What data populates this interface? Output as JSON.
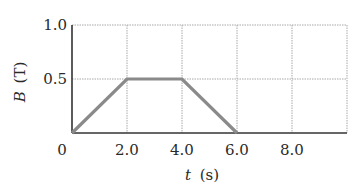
{
  "chart_data": {
    "type": "line",
    "title": "",
    "xlabel": "t (s)",
    "xlabel_var": "t",
    "xlabel_unit": "(s)",
    "ylabel": "B (T)",
    "ylabel_var": "B",
    "ylabel_unit": "(T)",
    "xlim": [
      0,
      10
    ],
    "ylim": [
      0,
      1.0
    ],
    "x_ticks": [
      0,
      2.0,
      4.0,
      6.0,
      8.0
    ],
    "x_tick_labels": [
      "0",
      "2.0",
      "4.0",
      "6.0",
      "8.0"
    ],
    "y_ticks": [
      0.5,
      1.0
    ],
    "y_tick_labels": [
      "0.5",
      "1.0"
    ],
    "grid": true,
    "legend": null,
    "series": [
      {
        "name": "B(t)",
        "x": [
          0,
          2.0,
          4.0,
          6.0
        ],
        "y": [
          0,
          0.5,
          0.5,
          0
        ]
      }
    ]
  },
  "style": {
    "line_color": "#8a8a8a",
    "axis_color": "#333333",
    "grid_color": "#a8a8a8"
  }
}
